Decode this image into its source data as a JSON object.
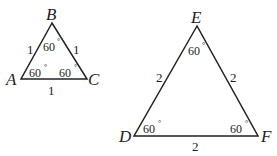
{
  "triangle_small": {
    "vertices": {
      "B": "B",
      "A": "A",
      "C": "C"
    },
    "sides": {
      "AB": "1",
      "BC": "1",
      "AC": "1"
    },
    "angles": {
      "B": "60",
      "A": "60",
      "C": "60"
    }
  },
  "triangle_large": {
    "vertices": {
      "E": "E",
      "D": "D",
      "F": "F"
    },
    "sides": {
      "DE": "2",
      "EF": "2",
      "DF": "2"
    },
    "angles": {
      "E": "60",
      "D": "60",
      "F": "60"
    }
  },
  "degree_symbol": "°",
  "stroke_color": "#222222"
}
